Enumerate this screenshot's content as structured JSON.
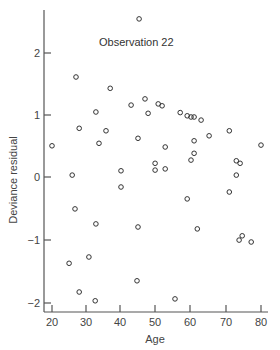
{
  "chart_data": {
    "type": "scatter",
    "title": "",
    "xlabel": "Age",
    "ylabel": "Deviance residual",
    "xlim": [
      18,
      82
    ],
    "ylim": [
      -2.15,
      2.85
    ],
    "xticks": [
      20,
      30,
      40,
      50,
      60,
      70,
      80
    ],
    "yticks": [
      -2,
      -1,
      0,
      1,
      2
    ],
    "grid": false,
    "legend": null,
    "annotations": [
      {
        "text": "Observation 22",
        "x": 45,
        "y": 2.53
      }
    ],
    "series": [
      {
        "name": "Deviance residuals",
        "marker": "open-circle",
        "points": [
          [
            20.0,
            0.5
          ],
          [
            25.8,
            0.03
          ],
          [
            26.6,
            -0.51
          ],
          [
            26.9,
            1.6
          ],
          [
            27.8,
            0.78
          ],
          [
            24.9,
            -1.38
          ],
          [
            27.8,
            -1.84
          ],
          [
            30.6,
            -1.28
          ],
          [
            32.4,
            -1.98
          ],
          [
            32.6,
            -0.75
          ],
          [
            32.6,
            1.04
          ],
          [
            33.5,
            0.54
          ],
          [
            35.5,
            0.74
          ],
          [
            36.7,
            1.42
          ],
          [
            39.8,
            0.1
          ],
          [
            39.8,
            -0.16
          ],
          [
            42.7,
            1.15
          ],
          [
            44.4,
            -1.66
          ],
          [
            44.7,
            0.62
          ],
          [
            44.7,
            -0.8
          ],
          [
            45.0,
            2.53
          ],
          [
            46.7,
            1.25
          ],
          [
            47.6,
            1.02
          ],
          [
            49.6,
            0.22
          ],
          [
            49.6,
            0.11
          ],
          [
            50.5,
            1.17
          ],
          [
            51.6,
            1.14
          ],
          [
            52.5,
            0.48
          ],
          [
            52.5,
            0.13
          ],
          [
            55.3,
            -1.95
          ],
          [
            56.8,
            1.03
          ],
          [
            58.8,
            0.98
          ],
          [
            58.8,
            -0.35
          ],
          [
            59.9,
            0.96
          ],
          [
            59.9,
            0.27
          ],
          [
            60.8,
            0.96
          ],
          [
            60.8,
            0.58
          ],
          [
            60.8,
            0.38
          ],
          [
            61.7,
            -0.83
          ],
          [
            62.8,
            0.91
          ],
          [
            65.1,
            0.66
          ],
          [
            70.9,
            0.74
          ],
          [
            70.9,
            -0.24
          ],
          [
            72.9,
            0.26
          ],
          [
            74.0,
            0.22
          ],
          [
            72.9,
            0.03
          ],
          [
            73.7,
            -1.01
          ],
          [
            74.6,
            -0.94
          ],
          [
            77.2,
            -1.04
          ],
          [
            80.0,
            0.51
          ]
        ]
      }
    ]
  },
  "labels": {
    "annotation": "Observation 22",
    "xlabel": "Age",
    "ylabel": "Deviance residual",
    "xticks": [
      "20",
      "30",
      "40",
      "50",
      "60",
      "70",
      "80"
    ],
    "yticks": [
      "2",
      "1",
      "0",
      "−1",
      "−2"
    ]
  }
}
